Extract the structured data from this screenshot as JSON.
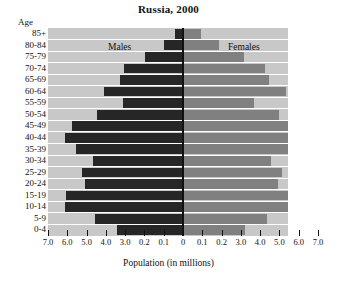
{
  "chart_data": {
    "type": "bar",
    "subtype": "population-pyramid",
    "title": "Russia, 2000",
    "xlabel": "Population (in millions)",
    "ylabel": "Age",
    "grid": true,
    "legend_position": "in-plot",
    "xlim": [
      -7.0,
      7.0
    ],
    "axis_tick_labels": [
      "7.0",
      "6.0",
      "5.0",
      "4.0",
      "3.0",
      "0.2",
      "0.1",
      "0",
      "0.1",
      "0.2",
      "3.0",
      "4.0",
      "5.0",
      "6.0",
      "7.0"
    ],
    "axis_tick_values": [
      -7.0,
      -6.0,
      -5.0,
      -4.0,
      -3.0,
      -2.0,
      -1.0,
      0,
      1.0,
      2.0,
      3.0,
      4.0,
      5.0,
      6.0,
      7.0
    ],
    "categories": [
      "0-4",
      "5-9",
      "10-14",
      "15-19",
      "20-24",
      "25-29",
      "30-34",
      "35-39",
      "40-44",
      "45-49",
      "50-54",
      "55-59",
      "60-64",
      "65-69",
      "70-74",
      "75-79",
      "80-84",
      "85+"
    ],
    "series": [
      {
        "name": "Males",
        "color": "#262626",
        "side": "left",
        "values": [
          3.4,
          4.55,
          6.1,
          6.05,
          5.1,
          5.25,
          4.65,
          5.55,
          6.1,
          5.75,
          4.45,
          3.1,
          4.1,
          3.25,
          3.05,
          1.95,
          1.0,
          0.4
        ]
      },
      {
        "name": "Females",
        "color": "#808080",
        "side": "right",
        "values": [
          3.2,
          4.35,
          5.8,
          5.75,
          4.95,
          5.15,
          4.55,
          5.6,
          6.25,
          6.0,
          5.0,
          3.7,
          5.35,
          4.45,
          4.25,
          3.15,
          1.85,
          0.95
        ]
      }
    ]
  },
  "labels": {
    "age_caption": "Age",
    "males": "Males",
    "females": "Females"
  },
  "colors": {
    "male_bar": "#262626",
    "female_bar": "#808080",
    "plot_background": "#c8c8c8",
    "gridline": "#ffffff",
    "axis": "#111111",
    "page_background": "#ffffff"
  }
}
